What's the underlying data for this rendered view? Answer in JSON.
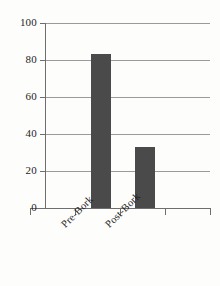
{
  "chart_data": {
    "type": "bar",
    "title": "",
    "subtitle": "",
    "xlabel": "",
    "ylabel": "",
    "categories": [
      "Pre-Bork",
      "Post-Bork"
    ],
    "values": [
      83,
      33
    ],
    "series": [
      {
        "name": "",
        "values": [
          83,
          33
        ]
      }
    ],
    "ylim": [
      0,
      100
    ],
    "yticks": [
      0,
      20,
      40,
      60,
      80,
      100
    ],
    "ytick_labels": [
      "0",
      "20",
      "40",
      "60",
      "80",
      "100"
    ],
    "grid": true,
    "grid_axis": "y",
    "legend": false,
    "legend_position": "none",
    "bar_color": "#4a4a4a",
    "gridline_color": "#9a9a9a",
    "axis_color": "#6e6e6e",
    "background_color": "#fdfdfc",
    "xtick_label_rotation": -45,
    "annotations": []
  }
}
